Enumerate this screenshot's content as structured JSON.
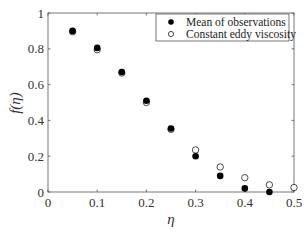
{
  "chart_data": {
    "type": "scatter",
    "title": "",
    "xlabel": "η",
    "ylabel": "f(η)",
    "xlim": [
      0,
      0.5
    ],
    "ylim": [
      0,
      1
    ],
    "xticks": [
      0,
      0.1,
      0.2,
      0.3,
      0.4,
      0.5
    ],
    "xtick_labels": [
      "0",
      "0.1",
      "0.2",
      "0.3",
      "0.4",
      "0.5"
    ],
    "yticks": [
      0,
      0.2,
      0.4,
      0.6,
      0.8,
      1
    ],
    "ytick_labels": [
      "0",
      "0.2",
      "0.4",
      "0.6",
      "0.8",
      "1"
    ],
    "grid": false,
    "legend_position": "upper right",
    "series": [
      {
        "name": "Mean of observations",
        "marker": "filled-circle",
        "color": "#000000",
        "x": [
          0.05,
          0.1,
          0.15,
          0.2,
          0.25,
          0.3,
          0.35,
          0.4,
          0.45
        ],
        "y": [
          0.9,
          0.805,
          0.67,
          0.51,
          0.355,
          0.2,
          0.09,
          0.02,
          0.0
        ]
      },
      {
        "name": "Constant eddy viscosity",
        "marker": "open-circle",
        "color": "#000000",
        "x": [
          0.05,
          0.1,
          0.15,
          0.2,
          0.25,
          0.3,
          0.35,
          0.4,
          0.45,
          0.5
        ],
        "y": [
          0.895,
          0.795,
          0.665,
          0.5,
          0.35,
          0.235,
          0.14,
          0.08,
          0.04,
          0.025
        ]
      }
    ]
  },
  "legend": {
    "items": [
      {
        "label": "Mean of observations",
        "marker": "filled-circle"
      },
      {
        "label": "Constant eddy viscosity",
        "marker": "open-circle"
      }
    ]
  },
  "axes": {
    "xlabel": "η",
    "ylabel": "f(η)"
  }
}
